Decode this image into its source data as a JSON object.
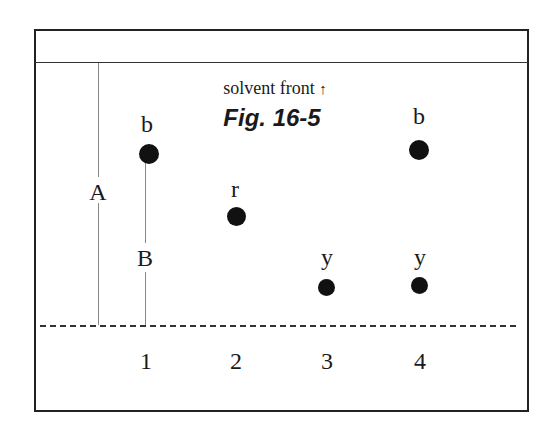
{
  "figure": {
    "title": "Fig. 16-5",
    "solvent_front_label": "solvent front",
    "solvent_front_arrow": "↑",
    "distance_labels": {
      "A": "A",
      "B": "B"
    },
    "lanes": [
      {
        "number": "1",
        "spots": [
          {
            "label": "b"
          }
        ]
      },
      {
        "number": "2",
        "spots": [
          {
            "label": "r"
          }
        ]
      },
      {
        "number": "3",
        "spots": [
          {
            "label": "y"
          }
        ]
      },
      {
        "number": "4",
        "spots": [
          {
            "label": "b"
          },
          {
            "label": "y"
          }
        ]
      }
    ]
  }
}
